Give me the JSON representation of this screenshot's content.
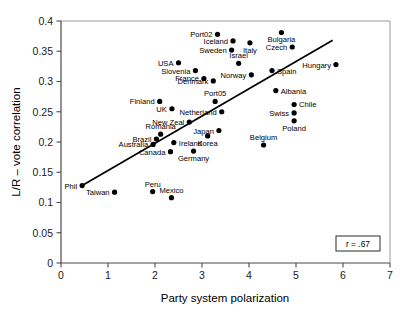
{
  "chart_data": {
    "type": "scatter",
    "title": "",
    "xlabel": "Party system polarization",
    "ylabel": "L/R – vote correlation",
    "xlim": [
      0,
      7
    ],
    "ylim": [
      0,
      0.4
    ],
    "xticks": [
      "0",
      "1",
      "2",
      "3",
      "4",
      "5",
      "6",
      "7"
    ],
    "yticks": [
      "0",
      "0.05",
      "0.1",
      "0.15",
      "0.2",
      "0.25",
      "0.3",
      "0.35",
      "0.4"
    ],
    "grid": false,
    "legend": null,
    "annotation": "r = .67",
    "correlation": 0.67,
    "trendline": {
      "x0": 0.45,
      "y0": 0.128,
      "x1": 5.78,
      "y1": 0.368
    },
    "points": [
      {
        "label": "Phil",
        "x": 0.45,
        "y": 0.128,
        "label_pos": "left"
      },
      {
        "label": "Taiwan",
        "x": 1.14,
        "y": 0.117,
        "label_pos": "left"
      },
      {
        "label": "Peru",
        "x": 1.95,
        "y": 0.118,
        "label_pos": "above"
      },
      {
        "label": "Mexico",
        "x": 2.35,
        "y": 0.108,
        "label_pos": "above"
      },
      {
        "label": "Australia",
        "x": 1.96,
        "y": 0.196,
        "label_pos": "left"
      },
      {
        "label": "Brazil",
        "x": 2.03,
        "y": 0.205,
        "label_pos": "left"
      },
      {
        "label": "Romania",
        "x": 2.12,
        "y": 0.213,
        "label_pos": "above"
      },
      {
        "label": "Canada",
        "x": 2.33,
        "y": 0.184,
        "label_pos": "left"
      },
      {
        "label": "Ireland",
        "x": 2.4,
        "y": 0.199,
        "label_pos": "right"
      },
      {
        "label": "Germany",
        "x": 2.82,
        "y": 0.185,
        "label_pos": "below"
      },
      {
        "label": "Finland",
        "x": 2.1,
        "y": 0.267,
        "label_pos": "left"
      },
      {
        "label": "UK",
        "x": 2.36,
        "y": 0.255,
        "label_pos": "left"
      },
      {
        "label": "New Zeal",
        "x": 2.73,
        "y": 0.233,
        "label_pos": "left"
      },
      {
        "label": "USA",
        "x": 2.5,
        "y": 0.331,
        "label_pos": "left"
      },
      {
        "label": "Slovenia",
        "x": 2.86,
        "y": 0.318,
        "label_pos": "left"
      },
      {
        "label": "France",
        "x": 3.04,
        "y": 0.305,
        "label_pos": "left"
      },
      {
        "label": "Denmark",
        "x": 3.24,
        "y": 0.301,
        "label_pos": "left"
      },
      {
        "label": "Port05",
        "x": 3.28,
        "y": 0.267,
        "label_pos": "above"
      },
      {
        "label": "Netherland",
        "x": 3.42,
        "y": 0.25,
        "label_pos": "left"
      },
      {
        "label": "Japan",
        "x": 3.36,
        "y": 0.219,
        "label_pos": "left"
      },
      {
        "label": "Korea",
        "x": 3.12,
        "y": 0.21,
        "label_pos": "below"
      },
      {
        "label": "Port02",
        "x": 3.33,
        "y": 0.378,
        "label_pos": "left"
      },
      {
        "label": "Iceland",
        "x": 3.66,
        "y": 0.367,
        "label_pos": "left"
      },
      {
        "label": "Sweden",
        "x": 3.63,
        "y": 0.352,
        "label_pos": "left"
      },
      {
        "label": "Israel",
        "x": 3.78,
        "y": 0.33,
        "label_pos": "above"
      },
      {
        "label": "Italy",
        "x": 4.02,
        "y": 0.364,
        "label_pos": "below"
      },
      {
        "label": "Norway",
        "x": 4.05,
        "y": 0.311,
        "label_pos": "left"
      },
      {
        "label": "Spain",
        "x": 4.49,
        "y": 0.318,
        "label_pos": "right"
      },
      {
        "label": "Bulgaria",
        "x": 4.69,
        "y": 0.381,
        "label_pos": "below"
      },
      {
        "label": "Czech",
        "x": 4.92,
        "y": 0.357,
        "label_pos": "left"
      },
      {
        "label": "Hungary",
        "x": 5.85,
        "y": 0.328,
        "label_pos": "left"
      },
      {
        "label": "Albania",
        "x": 4.57,
        "y": 0.285,
        "label_pos": "right"
      },
      {
        "label": "Chile",
        "x": 4.96,
        "y": 0.262,
        "label_pos": "right"
      },
      {
        "label": "Swiss",
        "x": 4.96,
        "y": 0.248,
        "label_pos": "left"
      },
      {
        "label": "Poland",
        "x": 4.96,
        "y": 0.235,
        "label_pos": "below"
      },
      {
        "label": "Belgium",
        "x": 4.31,
        "y": 0.195,
        "label_pos": "above"
      }
    ]
  }
}
